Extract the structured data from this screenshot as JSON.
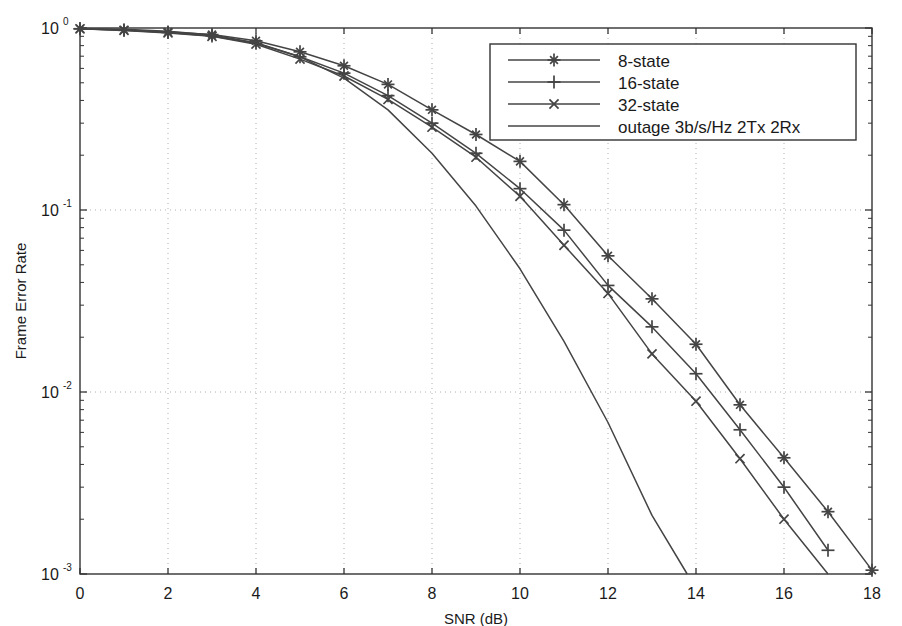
{
  "chart_data": {
    "type": "line",
    "title": "",
    "xlabel": "SNR (dB)",
    "ylabel": "Frame Error Rate",
    "xlim": [
      0,
      18
    ],
    "ylim": [
      0.001,
      1
    ],
    "yscale": "log",
    "xticks": [
      "0",
      "2",
      "4",
      "6",
      "8",
      "10",
      "12",
      "14",
      "16",
      "18"
    ],
    "xtick_values": [
      0,
      2,
      4,
      6,
      8,
      10,
      12,
      14,
      16,
      18
    ],
    "yticks": [
      "10^0",
      "10^-1",
      "10^-2",
      "10^-3"
    ],
    "ytick_values": [
      1,
      0.1,
      0.01,
      0.001
    ],
    "ytick_mantissa": "10",
    "ytick_exponents": [
      "0",
      "-1",
      "-2",
      "-3"
    ],
    "grid": true,
    "grid_style": "dotted",
    "legend_position": "upper right",
    "series": [
      {
        "name": "8-state",
        "marker": "star",
        "x": [
          0,
          1,
          2,
          3,
          4,
          5,
          6,
          7,
          8,
          9,
          10,
          11,
          12,
          13,
          14,
          15,
          16,
          17,
          18
        ],
        "y": [
          0.99,
          0.975,
          0.95,
          0.92,
          0.85,
          0.74,
          0.62,
          0.49,
          0.355,
          0.26,
          0.185,
          0.107,
          0.056,
          0.0325,
          0.0183,
          0.0085,
          0.00435,
          0.0022,
          0.00105
        ]
      },
      {
        "name": "16-state",
        "marker": "plus",
        "x": [
          0,
          1,
          2,
          3,
          4,
          5,
          6,
          7,
          8,
          9,
          10,
          11,
          12,
          13,
          14,
          15,
          16,
          17
        ],
        "y": [
          0.99,
          0.972,
          0.945,
          0.905,
          0.825,
          0.695,
          0.565,
          0.425,
          0.3,
          0.205,
          0.131,
          0.0775,
          0.0385,
          0.0228,
          0.0126,
          0.0062,
          0.003,
          0.00135
        ]
      },
      {
        "name": "32-state",
        "marker": "x",
        "x": [
          0,
          1,
          2,
          3,
          4,
          5,
          6,
          7,
          8,
          9,
          10,
          11,
          12,
          13,
          14,
          15,
          16,
          17
        ],
        "y": [
          0.99,
          0.97,
          0.94,
          0.9,
          0.815,
          0.675,
          0.545,
          0.405,
          0.285,
          0.195,
          0.119,
          0.064,
          0.0348,
          0.0162,
          0.0089,
          0.0043,
          0.002,
          0.00095
        ]
      },
      {
        "name": "outage 3b/s/Hz 2Tx 2Rx",
        "marker": "none",
        "x": [
          0,
          1,
          2,
          3,
          4,
          5,
          6,
          7,
          8,
          9,
          10,
          11,
          12,
          13,
          13.8
        ],
        "y": [
          0.995,
          0.985,
          0.96,
          0.915,
          0.83,
          0.695,
          0.53,
          0.355,
          0.205,
          0.105,
          0.0475,
          0.019,
          0.0068,
          0.0021,
          0.001
        ]
      }
    ]
  },
  "legend": {
    "entries": [
      {
        "label": "8-state",
        "marker": "star"
      },
      {
        "label": "16-state",
        "marker": "plus"
      },
      {
        "label": "32-state",
        "marker": "x"
      },
      {
        "label": "outage 3b/s/Hz 2Tx 2Rx",
        "marker": "none"
      }
    ]
  },
  "colors": {
    "line": "#444444",
    "axis": "#333333",
    "grid": "#b0b0b0",
    "background": "#ffffff"
  }
}
